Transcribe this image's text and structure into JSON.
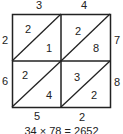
{
  "top_digits": [
    "3",
    "4"
  ],
  "right_digits": [
    "7",
    "8"
  ],
  "left_result_digits": [
    "2",
    "6"
  ],
  "bottom_result_digits": [
    "5",
    "2"
  ],
  "cells": [
    {
      "upper": "2",
      "lower": "1"
    },
    {
      "upper": "2",
      "lower": "8"
    },
    {
      "upper": "2",
      "lower": "4"
    },
    {
      "upper": "3",
      "lower": "2"
    }
  ],
  "caption": "34 × 78 = 2652"
}
